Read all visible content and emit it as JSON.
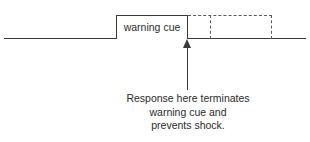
{
  "diagram": {
    "clipped_heading_above": "",
    "timeline": {
      "baseline_label": ""
    },
    "cue_box": {
      "label": "warning cue"
    },
    "dashed_box": {
      "label": ""
    },
    "arrow": {
      "label": ""
    },
    "caption": {
      "lines": [
        "Response here terminates",
        "warning cue and",
        "prevents shock."
      ]
    }
  },
  "colors": {
    "ink": "#3a3a3a",
    "text": "#2b2b2b",
    "dashed": "#5a5a5a",
    "background": "#ffffff"
  }
}
